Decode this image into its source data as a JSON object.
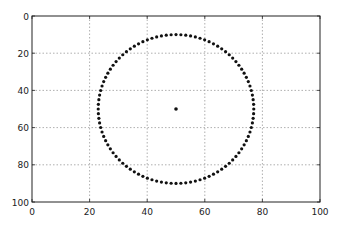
{
  "chart_data": {
    "type": "scatter",
    "title": "",
    "xlabel": "",
    "ylabel": "",
    "xlim": [
      0,
      100
    ],
    "ylim": [
      100,
      0
    ],
    "y_inverted": true,
    "grid": true,
    "x_ticks": [
      0,
      20,
      40,
      60,
      80,
      100
    ],
    "y_ticks": [
      0,
      20,
      40,
      60,
      80,
      100
    ],
    "x_tick_labels": [
      "0",
      "20",
      "40",
      "60",
      "80",
      "100"
    ],
    "y_tick_labels": [
      "0",
      "20",
      "40",
      "60",
      "80",
      "100"
    ],
    "series": [
      {
        "name": "ring",
        "kind": "ellipse-points",
        "center": [
          50,
          50
        ],
        "radius_x": 27,
        "radius_y": 40,
        "num_points": 100,
        "color": "#111111"
      },
      {
        "name": "center-point",
        "kind": "point",
        "x": [
          50
        ],
        "y": [
          50
        ],
        "color": "#111111"
      }
    ]
  }
}
